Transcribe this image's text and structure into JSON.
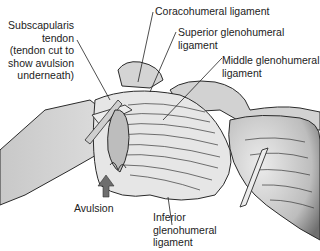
{
  "diagram": {
    "labels": {
      "subscapularis_line1": "Subscapularis",
      "subscapularis_line2": "tendon",
      "subscapularis_line3": "(tendon cut to",
      "subscapularis_line4": "show avulsion",
      "subscapularis_line5": "underneath)",
      "coracohumeral": "Coracohumeral ligament",
      "superior_line1": "Superior glenohumeral",
      "superior_line2": "ligament",
      "middle_line1": "Middle glenohumeral",
      "middle_line2": "ligament",
      "avulsion": "Avulsion",
      "inferior_line1": "Inferior",
      "inferior_line2": "glenohumeral",
      "inferior_line3": "ligament"
    },
    "colors": {
      "outline": "#2a2a2a",
      "bone_fill": "#d6d6d6",
      "ligament_fill": "#e4e4e4",
      "shadow": "#8a8a8a",
      "arrow": "#6e6e6e"
    }
  }
}
